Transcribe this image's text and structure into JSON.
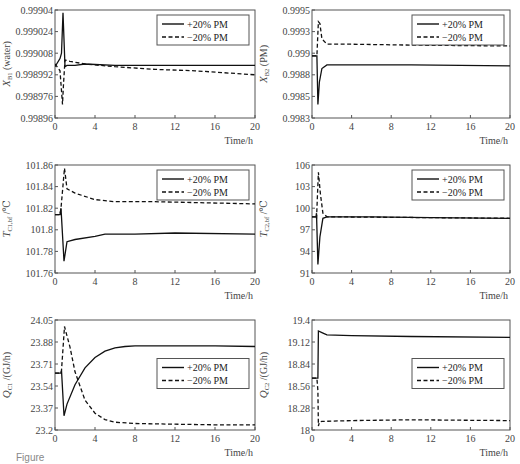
{
  "legend": {
    "plus": "+20% PM",
    "minus": "−20% PM"
  },
  "caption": "Figure",
  "chart_data": [
    {
      "type": "line",
      "id": "xb1",
      "ylabel": "X_B1 (water)",
      "xlabel": "Time/h",
      "xlim": [
        0,
        20
      ],
      "xticks": [
        0,
        4,
        8,
        12,
        16,
        20
      ],
      "ylim": [
        0.99896,
        0.99904
      ],
      "yticks": [
        "0.99896",
        "0.998976",
        "0.998992",
        "0.999008",
        "0.999024",
        "0.99904"
      ],
      "frame": {
        "x": 55,
        "y": 10,
        "w": 200,
        "h": 108
      },
      "legend_pos": "upper right",
      "series": [
        {
          "name": "+20% PM",
          "style": "solid",
          "points": [
            [
              0,
              0.998998
            ],
            [
              0.5,
              0.999004
            ],
            [
              0.65,
              0.999008
            ],
            [
              0.8,
              0.999038
            ],
            [
              1.0,
              0.998998
            ],
            [
              1.2,
              0.998999
            ],
            [
              2,
              0.998999
            ],
            [
              3,
              0.999
            ],
            [
              6,
              0.998999
            ],
            [
              10,
              0.998999
            ],
            [
              14,
              0.998999
            ],
            [
              20,
              0.998999
            ]
          ]
        },
        {
          "name": "−20% PM",
          "style": "dashed",
          "points": [
            [
              0,
              0.999
            ],
            [
              0.5,
              0.998995
            ],
            [
              0.75,
              0.99897
            ],
            [
              0.85,
              0.998985
            ],
            [
              1.0,
              0.999003
            ],
            [
              1.5,
              0.999002
            ],
            [
              3,
              0.999
            ],
            [
              6,
              0.998998
            ],
            [
              10,
              0.998996
            ],
            [
              14,
              0.998995
            ],
            [
              20,
              0.998992
            ]
          ]
        }
      ]
    },
    {
      "type": "line",
      "id": "xb2",
      "ylabel": "X_B2 (PM)",
      "xlabel": "Time/h",
      "xlim": [
        0,
        20
      ],
      "xticks": [
        0,
        4,
        8,
        12,
        16,
        20
      ],
      "ylim": [
        0.9983,
        0.9995
      ],
      "yticks": [
        "0.9983",
        "0.9985",
        "0.9988",
        "0.999",
        "0.9993",
        "0.9995"
      ],
      "frame": {
        "x": 312,
        "y": 10,
        "w": 198,
        "h": 108
      },
      "legend_pos": "upper right",
      "series": [
        {
          "name": "+20% PM",
          "style": "solid",
          "points": [
            [
              0,
              0.99899
            ],
            [
              0.5,
              0.99899
            ],
            [
              0.6,
              0.99845
            ],
            [
              0.75,
              0.9987
            ],
            [
              1.0,
              0.99885
            ],
            [
              1.5,
              0.99889
            ],
            [
              4,
              0.99889
            ],
            [
              10,
              0.99889
            ],
            [
              20,
              0.99888
            ]
          ]
        },
        {
          "name": "−20% PM",
          "style": "dashed",
          "points": [
            [
              0,
              0.99899
            ],
            [
              0.5,
              0.99899
            ],
            [
              0.65,
              0.99937
            ],
            [
              0.8,
              0.99935
            ],
            [
              1.0,
              0.99918
            ],
            [
              1.5,
              0.99912
            ],
            [
              4,
              0.99912
            ],
            [
              10,
              0.99911
            ],
            [
              20,
              0.9991
            ]
          ]
        }
      ]
    },
    {
      "type": "line",
      "id": "tc1",
      "ylabel": "T_C1,bf /℃",
      "xlabel": "Time/h",
      "xlim": [
        0,
        20
      ],
      "xticks": [
        0,
        4,
        8,
        12,
        16,
        20
      ],
      "ylim": [
        101.76,
        101.86
      ],
      "yticks": [
        "101.76",
        "101.78",
        "101.8",
        "101.82",
        "101.84",
        "101.86"
      ],
      "frame": {
        "x": 55,
        "y": 165,
        "w": 200,
        "h": 108
      },
      "legend_pos": "upper right",
      "series": [
        {
          "name": "+20% PM",
          "style": "solid",
          "points": [
            [
              0,
              101.814
            ],
            [
              0.5,
              101.814
            ],
            [
              0.6,
              101.82
            ],
            [
              0.9,
              101.771
            ],
            [
              1.2,
              101.789
            ],
            [
              2,
              101.791
            ],
            [
              4,
              101.794
            ],
            [
              5,
              101.796
            ],
            [
              8,
              101.796
            ],
            [
              12,
              101.797
            ],
            [
              20,
              101.796
            ]
          ]
        },
        {
          "name": "−20% PM",
          "style": "dashed",
          "points": [
            [
              0,
              101.814
            ],
            [
              0.5,
              101.814
            ],
            [
              0.6,
              101.82
            ],
            [
              0.95,
              101.857
            ],
            [
              1.2,
              101.838
            ],
            [
              2,
              101.834
            ],
            [
              4,
              101.828
            ],
            [
              6,
              101.826
            ],
            [
              10,
              101.826
            ],
            [
              20,
              101.824
            ]
          ]
        }
      ]
    },
    {
      "type": "line",
      "id": "tc2",
      "ylabel": "T_C2,bf /℃",
      "xlabel": "Time/h",
      "xlim": [
        0,
        20
      ],
      "xticks": [
        0,
        4,
        8,
        12,
        16,
        20
      ],
      "ylim": [
        91,
        106
      ],
      "yticks": [
        "91",
        "94",
        "97",
        "100",
        "103",
        "106"
      ],
      "frame": {
        "x": 312,
        "y": 165,
        "w": 198,
        "h": 108
      },
      "legend_pos": "upper right",
      "series": [
        {
          "name": "+20% PM",
          "style": "solid",
          "points": [
            [
              0,
              98.8
            ],
            [
              0.4,
              98.8
            ],
            [
              0.45,
              99.3
            ],
            [
              0.6,
              92.2
            ],
            [
              0.8,
              96
            ],
            [
              1.1,
              98.6
            ],
            [
              1.5,
              98.8
            ],
            [
              6,
              98.8
            ],
            [
              12,
              98.7
            ],
            [
              20,
              98.6
            ]
          ]
        },
        {
          "name": "−20% PM",
          "style": "dashed",
          "points": [
            [
              0,
              98.8
            ],
            [
              0.4,
              98.8
            ],
            [
              0.45,
              98.5
            ],
            [
              0.65,
              105
            ],
            [
              0.85,
              102
            ],
            [
              1.1,
              99.3
            ],
            [
              1.5,
              98.8
            ],
            [
              20,
              98.6
            ]
          ]
        }
      ]
    },
    {
      "type": "line",
      "id": "qc1",
      "ylabel": "Q_C1 /(GJ/h)",
      "xlabel": "Time/h",
      "xlim": [
        0,
        20
      ],
      "xticks": [
        0,
        4,
        8,
        12,
        16,
        20
      ],
      "ylim": [
        23.2,
        24.05
      ],
      "yticks": [
        "23.2",
        "23.37",
        "23.54",
        "23.71",
        "23.88",
        "24.05"
      ],
      "frame": {
        "x": 55,
        "y": 320,
        "w": 200,
        "h": 110
      },
      "legend_pos": "center right",
      "series": [
        {
          "name": "+20% PM",
          "style": "solid",
          "points": [
            [
              0,
              23.64
            ],
            [
              0.6,
              23.64
            ],
            [
              0.65,
              23.66
            ],
            [
              0.9,
              23.31
            ],
            [
              1.2,
              23.4
            ],
            [
              2,
              23.55
            ],
            [
              3,
              23.68
            ],
            [
              4,
              23.76
            ],
            [
              5,
              23.81
            ],
            [
              6,
              23.835
            ],
            [
              7,
              23.845
            ],
            [
              8,
              23.85
            ],
            [
              12,
              23.85
            ],
            [
              16,
              23.85
            ],
            [
              20,
              23.845
            ]
          ]
        },
        {
          "name": "−20% PM",
          "style": "dashed",
          "points": [
            [
              0,
              23.64
            ],
            [
              0.6,
              23.64
            ],
            [
              0.65,
              23.66
            ],
            [
              0.95,
              24.0
            ],
            [
              1.5,
              23.84
            ],
            [
              2,
              23.65
            ],
            [
              3,
              23.43
            ],
            [
              4,
              23.33
            ],
            [
              5,
              23.28
            ],
            [
              6,
              23.26
            ],
            [
              8,
              23.25
            ],
            [
              12,
              23.245
            ],
            [
              16,
              23.24
            ],
            [
              20,
              23.24
            ]
          ]
        }
      ]
    },
    {
      "type": "line",
      "id": "qc2",
      "ylabel": "Q_C2 /(GJ/h)",
      "xlabel": "Time/h",
      "xlim": [
        0,
        20
      ],
      "xticks": [
        0,
        4,
        8,
        12,
        16,
        20
      ],
      "ylim": [
        18,
        19.4
      ],
      "yticks": [
        "18",
        "18.28",
        "18.56",
        "18.84",
        "19.12",
        "19.4"
      ],
      "frame": {
        "x": 312,
        "y": 320,
        "w": 198,
        "h": 110
      },
      "legend_pos": "center right",
      "series": [
        {
          "name": "+20% PM",
          "style": "solid",
          "points": [
            [
              0,
              18.66
            ],
            [
              0.5,
              18.66
            ],
            [
              0.6,
              18.66
            ],
            [
              0.65,
              19.26
            ],
            [
              1.0,
              19.24
            ],
            [
              1.5,
              19.21
            ],
            [
              4,
              19.2
            ],
            [
              10,
              19.19
            ],
            [
              20,
              19.18
            ]
          ]
        },
        {
          "name": "−20% PM",
          "style": "dashed",
          "points": [
            [
              0,
              18.66
            ],
            [
              0.5,
              18.66
            ],
            [
              0.6,
              18.5
            ],
            [
              0.65,
              18.05
            ],
            [
              0.75,
              18.1
            ],
            [
              1.0,
              18.11
            ],
            [
              4,
              18.12
            ],
            [
              10,
              18.13
            ],
            [
              20,
              18.12
            ]
          ]
        }
      ]
    }
  ]
}
